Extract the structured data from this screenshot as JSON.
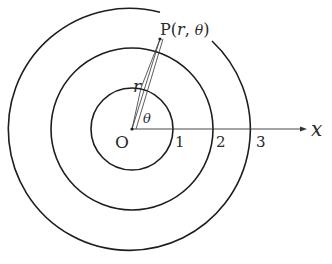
{
  "diagram": {
    "type": "polar-coordinates",
    "origin_label": "O",
    "axis_label": "x",
    "point_label": "P(r, θ)",
    "point_label_parts": {
      "prefix": "P(",
      "r": "r",
      "sep": ", ",
      "theta": "θ",
      "suffix": ")"
    },
    "radius_label": "r",
    "angle_label": "θ",
    "circle_labels": [
      "1",
      "2",
      "3"
    ],
    "circles": [
      {
        "radius_units": 1,
        "label": "1"
      },
      {
        "radius_units": 2,
        "label": "2"
      },
      {
        "radius_units": 3,
        "label": "3"
      }
    ],
    "colors": {
      "stroke": "#1e1e1e",
      "text": "#2a2a2a",
      "background": "#ffffff"
    }
  }
}
